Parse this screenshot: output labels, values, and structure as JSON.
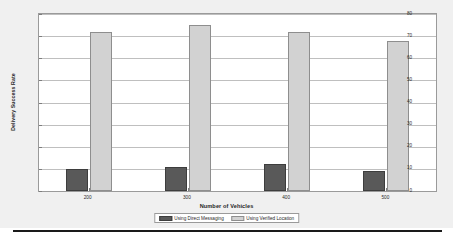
{
  "chart_data": {
    "type": "bar",
    "title": "",
    "xlabel": "Number of Vehicles",
    "ylabel": "Delivery Success Rate",
    "categories": [
      "200",
      "300",
      "400",
      "500"
    ],
    "series": [
      {
        "name": "Using Direct Messaging",
        "color": "#595959",
        "values": [
          10,
          11,
          12,
          9
        ]
      },
      {
        "name": "Using Verified Location",
        "color": "#d2d2d2",
        "values": [
          72,
          75,
          72,
          68
        ]
      }
    ],
    "ylim": [
      0,
      80
    ],
    "yticks": [
      0,
      10,
      20,
      30,
      40,
      50,
      60,
      70,
      80
    ],
    "ytick_labels": [
      "0",
      "10",
      "20",
      "30",
      "40",
      "50",
      "60",
      "70",
      "80"
    ],
    "grid": true,
    "grid_axis": "y",
    "legend_position": "bottom-center",
    "figure_background": "#f0f0f0",
    "axes_background": "#ffffff",
    "axes_border_color": "#9a9a9a",
    "gridline_color": "#bfbfbf"
  },
  "legend": {
    "entries": [
      {
        "label": "Using Direct Messaging",
        "swatch": "legend-swatch-direct-messaging"
      },
      {
        "label": "Using Verified Location",
        "swatch": "legend-swatch-verified-location"
      }
    ]
  }
}
